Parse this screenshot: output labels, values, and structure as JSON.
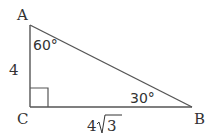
{
  "diagram": {
    "type": "right-triangle",
    "vertices": {
      "A": {
        "label": "A"
      },
      "B": {
        "label": "B"
      },
      "C": {
        "label": "C"
      }
    },
    "angles": {
      "A": "60°",
      "B": "30°",
      "C": "right-angle"
    },
    "sides": {
      "AC": {
        "coef": "4",
        "radical": "",
        "text": "4"
      },
      "CB": {
        "coef": "4",
        "radical": "3",
        "text": "4√3"
      }
    },
    "colors": {
      "stroke": "#555555",
      "text": "#333333"
    }
  }
}
